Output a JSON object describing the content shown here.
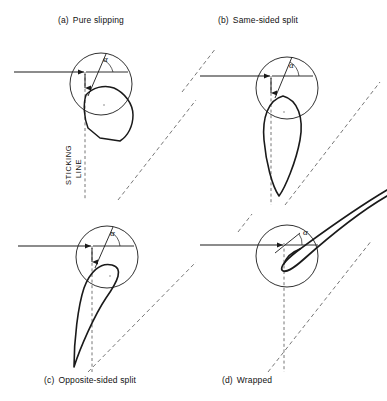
{
  "figure": {
    "background": "#ffffff",
    "line_color": "#1a1a1a",
    "dash_color": "#555555"
  },
  "panels": [
    {
      "id": "a",
      "tag": "(a)",
      "title": "Pure slipping",
      "angle_symbol": "α",
      "sticking_label_line1": "STICKING",
      "sticking_label_line2": "LINE"
    },
    {
      "id": "b",
      "tag": "(b)",
      "title": "Same-sided split",
      "angle_symbol": "α"
    },
    {
      "id": "c",
      "tag": "(c)",
      "title": "Opposite-sided split",
      "angle_symbol": "α"
    },
    {
      "id": "d",
      "tag": "(d)",
      "title": "Wrapped",
      "angle_symbol": "α"
    }
  ]
}
